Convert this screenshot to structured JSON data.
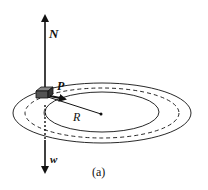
{
  "diagram": {
    "labels": {
      "normal_force": "N",
      "point": "P",
      "radius": "R",
      "weight": "w",
      "caption": "(a)"
    },
    "colors": {
      "stroke": "#111111",
      "background": "#ffffff",
      "block_fill": "#555555"
    }
  }
}
